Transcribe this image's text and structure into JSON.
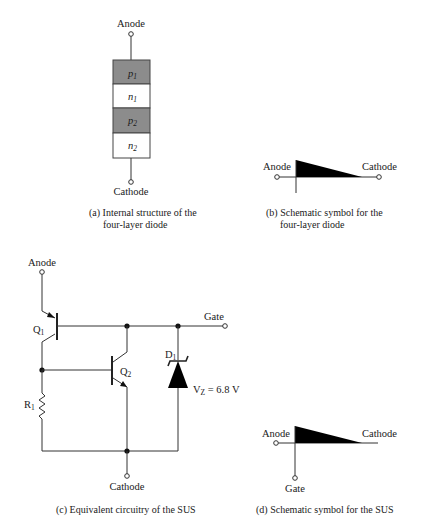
{
  "panels": {
    "a": {
      "top_label": "Anode",
      "bottom_label": "Cathode",
      "layers": [
        {
          "base": "p",
          "sub": "1",
          "type": "p"
        },
        {
          "base": "n",
          "sub": "1",
          "type": "n"
        },
        {
          "base": "p",
          "sub": "2",
          "type": "p"
        },
        {
          "base": "n",
          "sub": "2",
          "type": "n"
        }
      ],
      "caption_line1": "(a) Internal structure of the",
      "caption_line2": "four-layer diode"
    },
    "b": {
      "left_label": "Anode",
      "right_label": "Cathode",
      "caption_line1": "(b) Schematic symbol for the",
      "caption_line2": "four-layer diode"
    },
    "c": {
      "anode_label": "Anode",
      "cathode_label": "Cathode",
      "gate_label": "Gate",
      "q1": {
        "base": "Q",
        "sub": "1"
      },
      "q2": {
        "base": "Q",
        "sub": "2"
      },
      "r1": {
        "base": "R",
        "sub": "1"
      },
      "d1": {
        "base": "D",
        "sub": "1"
      },
      "vz": {
        "base": "V",
        "sub": "Z",
        "value": " = 6.8 V"
      },
      "caption": "(c) Equivalent circuitry of the SUS"
    },
    "d": {
      "left_label": "Anode",
      "right_label": "Cathode",
      "gate_label": "Gate",
      "caption": "(d) Schematic symbol for the SUS"
    }
  },
  "colors": {
    "p_layer": "#8c8c8c",
    "n_layer": "#ffffff",
    "line": "#333333"
  }
}
